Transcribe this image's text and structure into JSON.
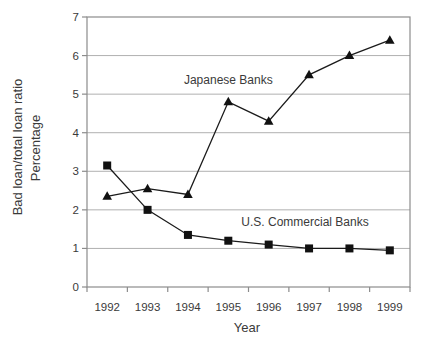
{
  "figure": {
    "background": "#ffffff"
  },
  "chart_data": {
    "type": "line",
    "title": "",
    "xlabel": "Year",
    "ylabel_lines": [
      "Bad loan/total loan ratio",
      "Percentage"
    ],
    "categories": [
      "1992",
      "1993",
      "1994",
      "1995",
      "1996",
      "1997",
      "1998",
      "1999"
    ],
    "series": [
      {
        "name": "Japanese Banks",
        "marker": "triangle",
        "values": [
          2.35,
          2.55,
          2.4,
          4.8,
          4.3,
          5.5,
          6.0,
          6.4
        ]
      },
      {
        "name": "U.S. Commercial Banks",
        "marker": "square",
        "values": [
          3.15,
          2.0,
          1.35,
          1.2,
          1.1,
          1.0,
          1.0,
          0.95
        ]
      }
    ],
    "annotations": [
      {
        "text": "Japanese Banks",
        "x_index": 3.0,
        "y_value": 5.37
      },
      {
        "text": "U.S. Commercial Banks",
        "x_index": 4.9,
        "y_value": 1.68
      }
    ],
    "ylim": [
      0,
      7
    ],
    "yticks": [
      0,
      1,
      2,
      3,
      4,
      5,
      6,
      7
    ],
    "grid": true,
    "legend_position": "inline-annotations",
    "colors": {
      "line": "#1b1b1b",
      "marker": "#111111",
      "grid": "#b0b0b0",
      "frame": "#8c8c8c",
      "text": "#3a3a3a"
    }
  }
}
